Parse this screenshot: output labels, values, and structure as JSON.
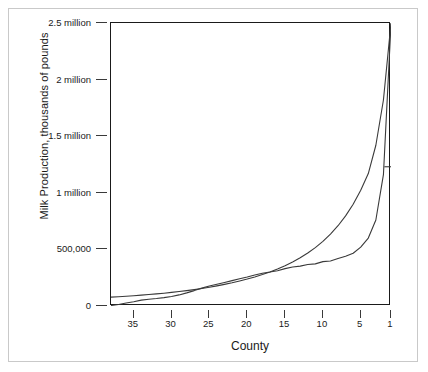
{
  "chart_data": {
    "type": "line",
    "title": "",
    "xlabel": "County",
    "ylabel": "Milk Production, thousands of pounds",
    "xlim": [
      38,
      1
    ],
    "ylim": [
      0,
      2500000
    ],
    "x_axis_reversed": true,
    "grid": false,
    "legend": "none",
    "yticks": [
      0,
      500000,
      1000000,
      1500000,
      2000000,
      2500000
    ],
    "ytick_labels": [
      "0",
      "500,000",
      "1 million",
      "1.5 million",
      "2 million",
      "2.5 million"
    ],
    "xticks": [
      35,
      30,
      25,
      20,
      15,
      10,
      5,
      1
    ],
    "xtick_labels": [
      "35",
      "30",
      "25",
      "20",
      "15",
      "10",
      "5",
      "1"
    ],
    "x": [
      38,
      37,
      36,
      35,
      34,
      33,
      32,
      31,
      30,
      29,
      28,
      27,
      26,
      25,
      24,
      23,
      22,
      21,
      20,
      19,
      18,
      17,
      16,
      15,
      14,
      13,
      12,
      11,
      10,
      9,
      8,
      7,
      6,
      5,
      4,
      3,
      2,
      1
    ],
    "series": [
      {
        "name": "Observed milk production",
        "style": "stepped-empirical",
        "values": [
          4000,
          14000,
          26000,
          38000,
          52000,
          60000,
          66000,
          74000,
          84000,
          98000,
          116000,
          136000,
          158000,
          176000,
          192000,
          208000,
          224000,
          240000,
          256000,
          274000,
          290000,
          300000,
          312000,
          330000,
          344000,
          352000,
          366000,
          372000,
          392000,
          398000,
          420000,
          440000,
          466000,
          520000,
          600000,
          760000,
          1160000,
          2490000
        ]
      },
      {
        "name": "Fitted exponential curve",
        "style": "smooth-fit",
        "values": [
          78000,
          82000,
          86000,
          91000,
          96000,
          101000,
          107000,
          113000,
          120000,
          128000,
          136000,
          145000,
          155000,
          166000,
          178000,
          191000,
          205000,
          221000,
          238000,
          257000,
          278000,
          301000,
          327000,
          356000,
          389000,
          426000,
          468000,
          516000,
          571000,
          635000,
          709000,
          796000,
          899000,
          1022000,
          1170000,
          1420000,
          1820000,
          2500000
        ]
      }
    ],
    "annotations": [
      {
        "type": "tick-marker",
        "x": 1.35,
        "y": 1230000,
        "label": ""
      }
    ],
    "colors": {
      "axis": "#1a1a1a",
      "series_observed": "#3a3a3a",
      "series_fitted": "#3a3a3a",
      "background": "#ffffff",
      "frame": "#c9c9c9"
    }
  }
}
